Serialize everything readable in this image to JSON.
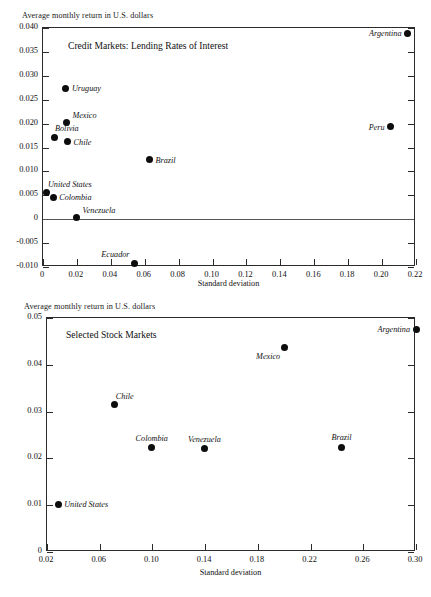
{
  "chart_data": [
    {
      "type": "scatter",
      "title": "Credit Markets:  Lending Rates of Interest",
      "ylabel_top": "Average monthly return in U.S. dollars",
      "xlabel": "Standard deviation",
      "xlim": [
        0,
        0.22
      ],
      "ylim": [
        -0.01,
        0.04
      ],
      "xticks": [
        "0",
        "0.02",
        "0.04",
        "0.06",
        "0.08",
        "0.10",
        "0.12",
        "0.14",
        "0.16",
        "0.18",
        "0.20",
        "0.22"
      ],
      "xtickvalues": [
        0,
        0.02,
        0.04,
        0.06,
        0.08,
        0.1,
        0.12,
        0.14,
        0.16,
        0.18,
        0.2,
        0.22
      ],
      "yticks": [
        "0.040",
        "0.035",
        "0.030",
        "0.025",
        "0.020",
        "0.015",
        "0.010",
        "0.005",
        "0",
        "-0.005",
        "-0.010"
      ],
      "ytickvalues": [
        0.04,
        0.035,
        0.03,
        0.025,
        0.02,
        0.015,
        0.01,
        0.005,
        0,
        -0.005,
        -0.01
      ],
      "grid": false,
      "zero_line": 0,
      "legend": "none",
      "points": [
        {
          "label": "Argentina",
          "x": 0.215,
          "y": 0.0389,
          "label_pos": "left"
        },
        {
          "label": "Peru",
          "x": 0.205,
          "y": 0.0193,
          "label_pos": "left"
        },
        {
          "label": "Uruguay",
          "x": 0.0135,
          "y": 0.0274,
          "label_pos": "right"
        },
        {
          "label": "Mexico",
          "x": 0.0138,
          "y": 0.0203,
          "label_pos": "right-up"
        },
        {
          "label": "Bolivia",
          "x": 0.0065,
          "y": 0.0171,
          "label_pos": "above-right"
        },
        {
          "label": "Chile",
          "x": 0.0145,
          "y": 0.0162,
          "label_pos": "right"
        },
        {
          "label": "Brazil",
          "x": 0.0628,
          "y": 0.0124,
          "label_pos": "right"
        },
        {
          "label": "United States",
          "x": 0.0023,
          "y": 0.0055,
          "label_pos": "above-right"
        },
        {
          "label": "Colombia",
          "x": 0.006,
          "y": 0.0046,
          "label_pos": "right"
        },
        {
          "label": "Venezuela",
          "x": 0.0198,
          "y": 0.0004,
          "label_pos": "right-up"
        },
        {
          "label": "Ecuador",
          "x": 0.054,
          "y": -0.0092,
          "label_pos": "above-left"
        }
      ]
    },
    {
      "type": "scatter",
      "title": "Selected Stock Markets",
      "ylabel_top": "Average monthly return in U.S. dollars",
      "xlabel": "Standard deviation",
      "xlim": [
        0.02,
        0.3
      ],
      "ylim": [
        0,
        0.05
      ],
      "xticks": [
        "0.02",
        "0.06",
        "0.10",
        "0.14",
        "0.18",
        "0.22",
        "0.26",
        "0.30"
      ],
      "xtickvalues": [
        0.02,
        0.06,
        0.1,
        0.14,
        0.18,
        0.22,
        0.26,
        0.3
      ],
      "yticks": [
        "0.05",
        "0.04",
        "0.03",
        "0.02",
        "0.01",
        "0"
      ],
      "ytickvalues": [
        0.05,
        0.04,
        0.03,
        0.02,
        0.01,
        0
      ],
      "grid": false,
      "legend": "none",
      "points": [
        {
          "label": "Argentina",
          "x": 0.3,
          "y": 0.0476,
          "label_pos": "left"
        },
        {
          "label": "Mexico",
          "x": 0.2,
          "y": 0.0436,
          "label_pos": "below-left"
        },
        {
          "label": "Chile",
          "x": 0.0715,
          "y": 0.0315,
          "label_pos": "above-right"
        },
        {
          "label": "Colombia",
          "x": 0.0995,
          "y": 0.0223,
          "label_pos": "above"
        },
        {
          "label": "Venezuela",
          "x": 0.1395,
          "y": 0.0221,
          "label_pos": "above"
        },
        {
          "label": "Brazil",
          "x": 0.2435,
          "y": 0.0224,
          "label_pos": "above"
        },
        {
          "label": "United States",
          "x": 0.0285,
          "y": 0.0102,
          "label_pos": "right"
        }
      ]
    }
  ],
  "panels": [
    {
      "caption": "Average monthly return in U.S. dollars",
      "title": "Credit Markets:  Lending Rates of Interest",
      "axis_title": "Standard deviation"
    },
    {
      "caption": "Average monthly return in U.S. dollars",
      "title": "Selected Stock Markets",
      "axis_title": "Standard deviation"
    }
  ]
}
